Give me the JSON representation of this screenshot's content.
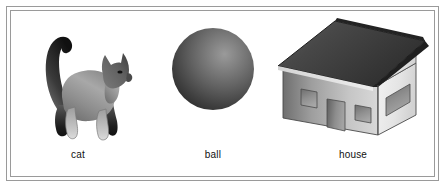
{
  "figure": {
    "background_color": "#ffffff",
    "border_color": "#9a9a9a",
    "border_style": "double-line-rectangle",
    "label_color": "#111111"
  },
  "items": [
    {
      "id": "cat",
      "label": "cat",
      "icon": "cat-silhouette-icon",
      "description": "gray gradient cat standing in profile facing right with upright curled tail",
      "colors": {
        "body_light": "#b9b9b9",
        "body_dark": "#6e6e6e",
        "accent_dark": "#1c1c1c"
      }
    },
    {
      "id": "ball",
      "label": "ball",
      "icon": "sphere-ball-icon",
      "description": "dark gray shaded sphere with highlight in upper right",
      "colors": {
        "highlight": "#8f8f8f",
        "mid": "#595959",
        "shadow": "#2b2b2b"
      }
    },
    {
      "id": "house",
      "label": "house",
      "icon": "house-3d-icon",
      "description": "three dimensional house with dark gabled roof, front wall with two windows and a door, right gable wall with a wide window",
      "colors": {
        "roof_dark": "#3a3a3a",
        "roof_light": "#5e5e5e",
        "wall_light": "#e2e2e2",
        "wall_dark": "#7e7e7e",
        "opening": "#8c8c8c"
      }
    }
  ]
}
